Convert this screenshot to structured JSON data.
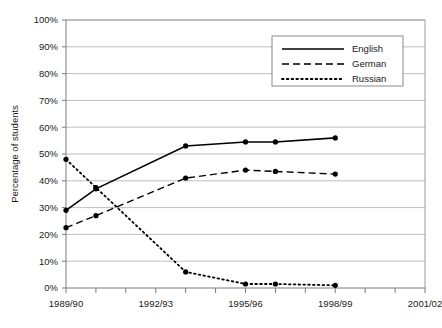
{
  "chart_data": {
    "type": "line",
    "title": "",
    "xlabel": "",
    "ylabel": "Percentage of students",
    "ylim": [
      0,
      100
    ],
    "ytick_labels": [
      "0%",
      "10%",
      "20%",
      "30%",
      "40%",
      "50%",
      "60%",
      "70%",
      "80%",
      "90%",
      "100%"
    ],
    "ytick_values": [
      0,
      10,
      20,
      30,
      40,
      50,
      60,
      70,
      80,
      90,
      100
    ],
    "x_index_count": 10,
    "xtick_labels": [
      "1989/90",
      "1992/93",
      "1995/96",
      "1998/99",
      "2001/02"
    ],
    "xtick_indices": [
      0,
      3,
      6,
      9,
      12
    ],
    "grid": "horizontal",
    "legend_position": "top-center-right",
    "series": [
      {
        "name": "English",
        "style": "solid",
        "x_indices": [
          0,
          1,
          4,
          6,
          7,
          9
        ],
        "x_labels": [
          "1989/90",
          "1990/91",
          "1995/96",
          "1998/99",
          "1999/00",
          "2001/02"
        ],
        "values": [
          29,
          37,
          53,
          54.5,
          54.5,
          56
        ]
      },
      {
        "name": "German",
        "style": "dashed",
        "x_indices": [
          0,
          1,
          4,
          6,
          7,
          9
        ],
        "x_labels": [
          "1989/90",
          "1990/91",
          "1995/96",
          "1998/99",
          "1999/00",
          "2001/02"
        ],
        "values": [
          22.5,
          27,
          41,
          44,
          43.5,
          42.5
        ]
      },
      {
        "name": "Russian",
        "style": "dotted",
        "x_indices": [
          0,
          1,
          4,
          6,
          7,
          9
        ],
        "x_labels": [
          "1989/90",
          "1990/91",
          "1995/96",
          "1998/99",
          "1999/00",
          "2001/02"
        ],
        "values": [
          48,
          37.5,
          6,
          1.5,
          1.5,
          1
        ]
      }
    ]
  },
  "legend": {
    "entries": [
      {
        "label": "English",
        "style": "solid"
      },
      {
        "label": "German",
        "style": "dashed"
      },
      {
        "label": "Russian",
        "style": "dotted"
      }
    ]
  },
  "colors": {
    "line": "#000000",
    "grid": "#aeaeae",
    "axis": "#7a7a7a",
    "background": "#ffffff",
    "text": "#1a1a1a"
  }
}
